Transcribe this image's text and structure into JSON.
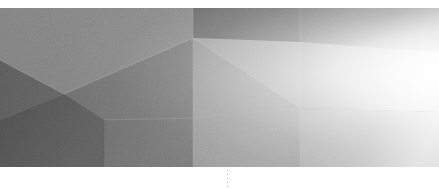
{
  "page": {
    "width": 439,
    "height": 189,
    "background_color": "#ffffff",
    "kind": "abstract-banner-image"
  },
  "banner": {
    "alt_text": "Abstract low-poly faceted grayscale banner",
    "top_margin_px": 8,
    "bottom_margin_px": 22,
    "artwork_height_px": 159,
    "palette": {
      "darkest": "#4e4e4e",
      "dark": "#5a5a5a",
      "mid_dark": "#6b6b6b",
      "mid": "#7a7a7a",
      "mid_light": "#8c8c8c",
      "light": "#a2a2a2",
      "lighter": "#b6b6b6",
      "lightest": "#d4d4d4",
      "highlight": "#ffffff"
    },
    "facets": [
      {
        "name": "upper-left-wedge",
        "fill": "#7d7d7d",
        "points": "0,0 193,0 193,30 64,86 0,52"
      },
      {
        "name": "left-dark-band",
        "fill": "#5f5f5f",
        "points": "0,52 64,86 0,112"
      },
      {
        "name": "left-lower-dark",
        "fill": "#565656",
        "points": "0,112 64,86 104,112 104,159 0,159"
      },
      {
        "name": "center-left-slab",
        "fill": "#6e6e6e",
        "points": "64,86 193,30 193,110 104,112"
      },
      {
        "name": "center-lower-slab",
        "fill": "#727272",
        "points": "104,112 193,110 193,159 104,159"
      },
      {
        "name": "upper-center-dark",
        "fill": "#6a6a6a",
        "points": "193,0 300,0 300,34 193,30"
      },
      {
        "name": "upper-right-dark",
        "fill": "#767676",
        "points": "300,0 439,0 439,44 300,34"
      },
      {
        "name": "center-bright-triangle",
        "fill": "#a6a6a6",
        "points": "193,30 300,34 300,100"
      },
      {
        "name": "center-mid-triangle",
        "fill": "#9a9a9a",
        "points": "193,30 300,100 193,110"
      },
      {
        "name": "center-bottom-wedge",
        "fill": "#9f9f9f",
        "points": "193,110 300,100 300,159 193,159"
      },
      {
        "name": "right-upper-panel",
        "fill": "#b0b0b0",
        "points": "300,34 439,44 439,104 300,100"
      },
      {
        "name": "right-lower-panel",
        "fill": "#bdbdbd",
        "points": "300,100 439,104 439,159 300,159"
      }
    ],
    "edge_highlights": [
      {
        "name": "ridge-left-diagonal",
        "from": [
          0,
          52
        ],
        "to": [
          64,
          86
        ]
      },
      {
        "name": "ridge-center-top",
        "from": [
          64,
          86
        ],
        "to": [
          193,
          30
        ]
      },
      {
        "name": "ridge-vertical-193",
        "from": [
          193,
          0
        ],
        "to": [
          193,
          159
        ]
      },
      {
        "name": "ridge-vertical-300",
        "from": [
          300,
          0
        ],
        "to": [
          300,
          159
        ]
      },
      {
        "name": "ridge-center-fan-a",
        "from": [
          193,
          30
        ],
        "to": [
          300,
          100
        ]
      },
      {
        "name": "ridge-center-fan-b",
        "from": [
          193,
          110
        ],
        "to": [
          300,
          100
        ]
      },
      {
        "name": "ridge-lower-left",
        "from": [
          104,
          112
        ],
        "to": [
          193,
          110
        ]
      }
    ],
    "vertices": [
      {
        "name": "apex-center",
        "x": 193,
        "y": 30
      },
      {
        "name": "node-left",
        "x": 64,
        "y": 86
      },
      {
        "name": "node-right",
        "x": 300,
        "y": 100
      },
      {
        "name": "node-lower-left",
        "x": 104,
        "y": 112
      }
    ]
  },
  "dotted_rule": {
    "name": "vertical-dotted-divider",
    "x": 227,
    "top": 168,
    "height": 21,
    "color": "#b9b9b9",
    "dot_count": 6,
    "dot_spacing_px": 4
  }
}
